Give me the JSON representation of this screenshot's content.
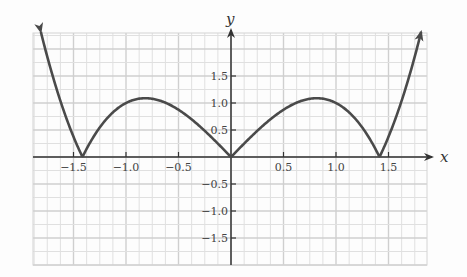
{
  "chart_data": {
    "type": "line",
    "title": "",
    "xlabel": "x",
    "ylabel": "y",
    "xlim": [
      -1.875,
      1.875
    ],
    "ylim": [
      -2.0,
      2.25
    ],
    "grid": true,
    "x_ticks": [
      -1.5,
      -1.0,
      -0.5,
      0.5,
      1.0,
      1.5
    ],
    "x_tick_labels": [
      "−1.5",
      "−1.0",
      "−0.5",
      "0.5",
      "1.0",
      "1.5"
    ],
    "y_ticks": [
      1.5,
      1.0,
      0.5,
      -0.5,
      -1.0,
      -1.5
    ],
    "y_tick_labels": [
      "1.5",
      "1.0",
      "0.5",
      "−0.5",
      "−1.0",
      "−1.5"
    ],
    "series": [
      {
        "name": "y = |x^3 - 2x|",
        "color": "#4a4a4a",
        "arrows_at_ends": true,
        "x": [
          -1.82,
          -1.7,
          -1.6,
          -1.5,
          -1.414,
          -1.3,
          -1.2,
          -1.1,
          -1.0,
          -0.9,
          -0.816,
          -0.7,
          -0.6,
          -0.5,
          -0.4,
          -0.3,
          -0.2,
          -0.1,
          0.0,
          0.1,
          0.2,
          0.3,
          0.4,
          0.5,
          0.6,
          0.7,
          0.816,
          0.9,
          1.0,
          1.1,
          1.2,
          1.3,
          1.414,
          1.5,
          1.6,
          1.7,
          1.82
        ],
        "y": [
          2.39,
          1.51,
          0.9,
          0.38,
          0.0,
          0.4,
          0.67,
          0.87,
          1.0,
          1.07,
          1.09,
          1.06,
          0.98,
          0.88,
          0.74,
          0.57,
          0.39,
          0.2,
          0.0,
          0.2,
          0.39,
          0.57,
          0.74,
          0.88,
          0.98,
          1.06,
          1.09,
          1.07,
          1.0,
          0.87,
          0.67,
          0.4,
          0.0,
          0.38,
          0.9,
          1.51,
          2.39
        ]
      }
    ],
    "key_points": {
      "zeros": [
        -1.414,
        0.0,
        1.414
      ],
      "local_maxima": [
        [
          -0.816,
          1.09
        ],
        [
          0.816,
          1.09
        ]
      ]
    }
  }
}
